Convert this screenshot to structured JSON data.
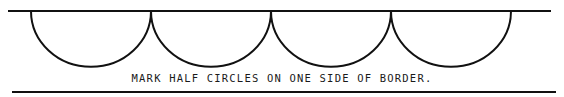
{
  "diagram": {
    "caption": "MARK HALF CIRCLES ON ONE SIDE OF BORDER.",
    "half_circle_count": 4,
    "line_color": "#111111"
  }
}
